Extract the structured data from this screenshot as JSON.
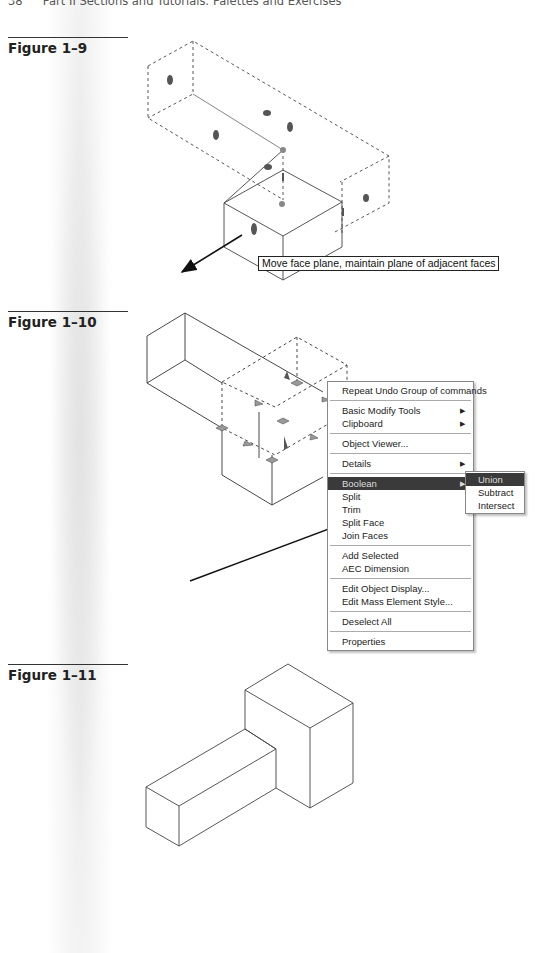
{
  "page": {
    "running_head": {
      "page_number": "38",
      "title": "Part II   Sections and Tutorials: Palettes and Exercises"
    }
  },
  "figures": [
    {
      "label": "Figure 1–9",
      "tooltip": "Move face plane, maintain plane of adjacent faces"
    },
    {
      "label": "Figure 1–10"
    },
    {
      "label": "Figure 1–11"
    }
  ],
  "context_menu": {
    "groups": [
      [
        {
          "label": "Repeat Undo Group of commands",
          "submenu": false
        }
      ],
      [
        {
          "label": "Basic Modify Tools",
          "submenu": true
        },
        {
          "label": "Clipboard",
          "submenu": true
        }
      ],
      [
        {
          "label": "Object Viewer...",
          "submenu": false
        }
      ],
      [
        {
          "label": "Details",
          "submenu": true
        }
      ],
      [
        {
          "label": "Boolean",
          "submenu": true,
          "active": true
        },
        {
          "label": "Split"
        },
        {
          "label": "Trim"
        },
        {
          "label": "Split Face"
        },
        {
          "label": "Join Faces"
        }
      ],
      [
        {
          "label": "Add Selected"
        },
        {
          "label": "AEC Dimension"
        }
      ],
      [
        {
          "label": "Edit Object Display..."
        },
        {
          "label": "Edit Mass Element Style..."
        }
      ],
      [
        {
          "label": "Deselect All"
        }
      ],
      [
        {
          "label": "Properties"
        }
      ]
    ],
    "submenu_arrow": "▶",
    "boolean_submenu": [
      {
        "label": "Union",
        "active": true
      },
      {
        "label": "Subtract"
      },
      {
        "label": "Intersect"
      }
    ]
  },
  "colors": {
    "menu_highlight": "#3a3a3a",
    "line": "#333333"
  }
}
